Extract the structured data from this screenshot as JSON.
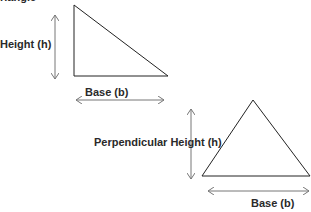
{
  "title": "riangle",
  "diagram1": {
    "type": "right-triangle",
    "height_label": "Height (h)",
    "base_label": "Base (b)"
  },
  "diagram2": {
    "type": "triangle",
    "height_label": "Perpendicular Height (h)",
    "base_label": "Base (b)"
  },
  "colors": {
    "line": "#222222",
    "arrow": "#777777",
    "text": "#2a2a2a"
  }
}
